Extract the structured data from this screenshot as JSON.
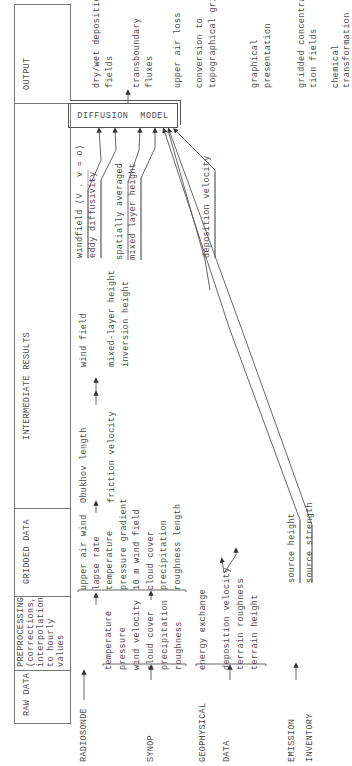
{
  "header": {
    "columns": [
      {
        "id": "raw",
        "label": "RAW DATA"
      },
      {
        "id": "pre",
        "lines": [
          "PREPROCESSING",
          "(corrections,",
          "interpolation",
          "to hourly",
          "values"
        ]
      },
      {
        "id": "grid",
        "label": "GRIDDED DATA"
      },
      {
        "id": "inter",
        "label": "INTERMEDIATE RESULTS"
      },
      {
        "id": "out",
        "label": "OUTPUT"
      }
    ]
  },
  "raw_data": {
    "radiosonde": "RADIOSONDE",
    "synop": "SYNOP",
    "geophysical": "GEOPHYSICAL",
    "data": "DATA",
    "emission": "EMISSION",
    "inventory": "INVENTORY"
  },
  "preprocessing": {
    "synop_items": [
      "temperature",
      "pressure",
      "wind velocity",
      "cloud cover",
      "precipitation",
      "roughness"
    ],
    "geophysical_items": [
      "energy exchange",
      "deposition velocity",
      "terrain roughness",
      "terrain height"
    ]
  },
  "gridded_data": {
    "items": [
      "upper air wind",
      "lapse rate",
      "temperature",
      "pressure gradient",
      "10 m wind field",
      "cloud cover",
      "precipitation",
      "roughness length"
    ],
    "source_items": [
      "source height",
      "source strength"
    ]
  },
  "intermediate_results": {
    "items": [
      "Obukhov length",
      "friction velocity",
      "wind field",
      "mixed-layer height",
      "inversion height"
    ]
  },
  "model_inputs": {
    "items": [
      "windfield (V . v = o)",
      "eddy diffusivity",
      "spatially averaged",
      "mixed layer height",
      "deposition velocity"
    ]
  },
  "model": {
    "label": "DIFFUSION MODEL"
  },
  "output": {
    "items": [
      [
        "dry/wet deposition",
        "fields"
      ],
      [
        "transboundary",
        "fluxes"
      ],
      [
        "upper air loss"
      ],
      [
        "conversion to",
        "topographical grid"
      ],
      [
        "graphical",
        "presentation"
      ],
      [
        "gridded concentra-",
        "tion fields"
      ],
      [
        "chemical",
        "transformation"
      ]
    ]
  }
}
